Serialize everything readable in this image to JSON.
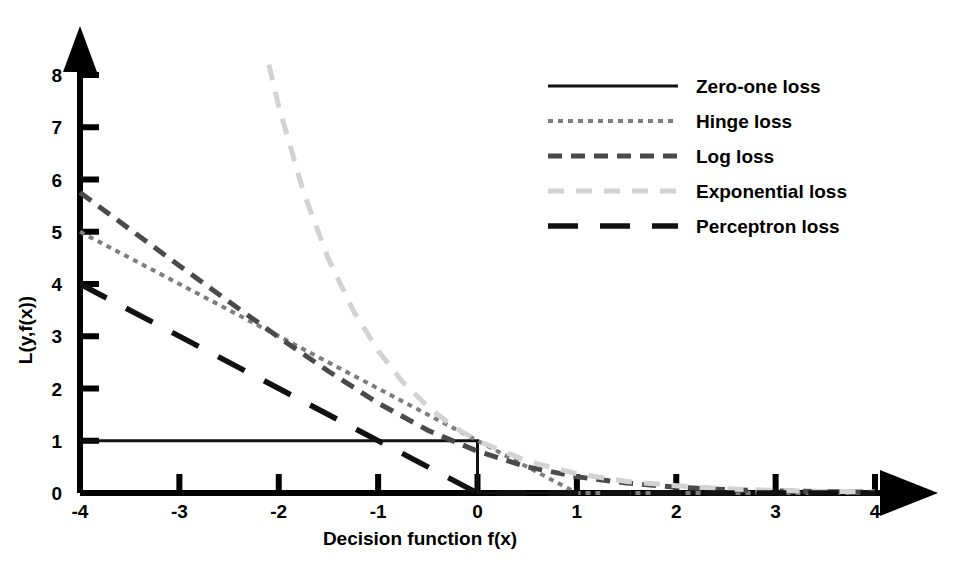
{
  "chart_data": {
    "type": "line",
    "title": "",
    "xlabel": "Decision function f(x)",
    "ylabel": "L(y,f(x))",
    "xlim": [
      -4,
      4
    ],
    "ylim": [
      0,
      8
    ],
    "xticks": [
      -4,
      -3,
      -2,
      -1,
      0,
      1,
      2,
      3,
      4
    ],
    "xtick_labels": [
      "-4",
      "-3",
      "-2",
      "-1",
      "0",
      "1",
      "2",
      "3",
      "4"
    ],
    "yticks": [
      0,
      1,
      2,
      3,
      4,
      5,
      6,
      7,
      8
    ],
    "ytick_labels": [
      "0",
      "1",
      "2",
      "3",
      "4",
      "5",
      "6",
      "7",
      "8"
    ],
    "grid": false,
    "legend_position": "upper right",
    "series": [
      {
        "name": "Zero-one loss",
        "style": "solid",
        "color": "#111111",
        "width": 3.0,
        "dash": "",
        "points": [
          [
            -4,
            1
          ],
          [
            -0.02,
            1
          ],
          [
            0,
            1
          ],
          [
            0,
            0
          ],
          [
            4,
            0
          ]
        ]
      },
      {
        "name": "Hinge loss",
        "style": "dotted",
        "color": "#7d7d7d",
        "width": 4.0,
        "dash": "5,5",
        "points": [
          [
            -4,
            5
          ],
          [
            -3,
            4
          ],
          [
            -2,
            3
          ],
          [
            -1,
            2
          ],
          [
            0,
            1
          ],
          [
            1,
            0
          ],
          [
            2,
            0
          ],
          [
            3,
            0
          ],
          [
            4,
            0
          ]
        ]
      },
      {
        "name": "Log loss",
        "style": "dashed",
        "color": "#4a4a4a",
        "width": 5.0,
        "dash": "14,9",
        "points": [
          [
            -4,
            5.75
          ],
          [
            -3.5,
            5.05
          ],
          [
            -3,
            4.35
          ],
          [
            -2.5,
            3.66
          ],
          [
            -2,
            2.98
          ],
          [
            -1.5,
            2.33
          ],
          [
            -1,
            1.72
          ],
          [
            -0.5,
            1.2
          ],
          [
            0,
            0.8
          ],
          [
            0.5,
            0.5
          ],
          [
            1,
            0.31
          ],
          [
            1.5,
            0.19
          ],
          [
            2,
            0.11
          ],
          [
            2.5,
            0.065
          ],
          [
            3,
            0.04
          ],
          [
            3.5,
            0.025
          ],
          [
            4,
            0.015
          ]
        ]
      },
      {
        "name": "Exponential loss",
        "style": "dashed",
        "color": "#d2d2d2",
        "width": 5.0,
        "dash": "16,12",
        "points": [
          [
            -2.1,
            8.2
          ],
          [
            -2,
            7.4
          ],
          [
            -1.75,
            5.75
          ],
          [
            -1.5,
            4.48
          ],
          [
            -1.25,
            3.49
          ],
          [
            -1,
            2.72
          ],
          [
            -0.75,
            2.12
          ],
          [
            -0.5,
            1.65
          ],
          [
            -0.25,
            1.28
          ],
          [
            0,
            1.0
          ],
          [
            0.5,
            0.61
          ],
          [
            1,
            0.37
          ],
          [
            1.5,
            0.22
          ],
          [
            2,
            0.14
          ],
          [
            2.5,
            0.08
          ],
          [
            3,
            0.05
          ],
          [
            3.5,
            0.03
          ],
          [
            4,
            0.02
          ]
        ]
      },
      {
        "name": "Perceptron loss",
        "style": "long-dash",
        "color": "#111111",
        "width": 5.5,
        "dash": "30,22",
        "points": [
          [
            -4,
            4
          ],
          [
            0,
            0
          ],
          [
            4,
            0
          ]
        ]
      }
    ]
  },
  "axes": {
    "x_arrow": "arrow-right",
    "y_arrow": "arrow-up"
  },
  "legend": {
    "items": [
      {
        "label": "Zero-one loss",
        "swatch": "solid-line-swatch"
      },
      {
        "label": "Hinge loss",
        "swatch": "dotted-line-swatch"
      },
      {
        "label": "Log loss",
        "swatch": "dashed-line-swatch"
      },
      {
        "label": "Exponential loss",
        "swatch": "light-dashed-line-swatch"
      },
      {
        "label": "Perceptron loss",
        "swatch": "long-dashed-line-swatch"
      }
    ]
  }
}
